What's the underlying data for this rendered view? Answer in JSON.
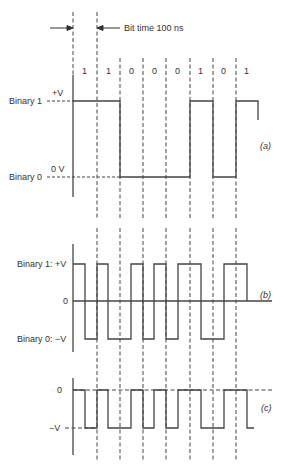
{
  "bit_time_label": "Bit time 100 ns",
  "bits": [
    "1",
    "1",
    "0",
    "0",
    "0",
    "1",
    "0",
    "1"
  ],
  "panel_a": {
    "tag": "(a)",
    "high_level_label": "+V",
    "high_binary_label": "Binary 1",
    "low_level_label": "0 V",
    "low_binary_label": "Binary 0"
  },
  "panel_b": {
    "tag": "(b)",
    "high_label": "Binary 1: +V",
    "zero_label": "0",
    "low_label": "Binary 0: −V"
  },
  "panel_c": {
    "tag": "(c)",
    "zero_label": "0",
    "low_label": "−V"
  },
  "colors": {
    "line": "#333333",
    "dash": "#444444",
    "text": "#333333"
  }
}
